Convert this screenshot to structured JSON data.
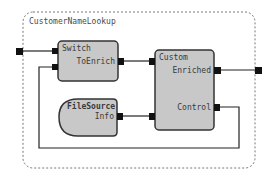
{
  "diagram": {
    "container": {
      "title": "CustomerNameLookup"
    },
    "nodes": [
      {
        "id": "switch",
        "label": "Switch",
        "shape": "rounded-rect",
        "ports_in": [
          "in1",
          "in2"
        ],
        "ports_out": [
          {
            "label": "ToEnrich"
          }
        ]
      },
      {
        "id": "custom",
        "label": "Custom",
        "shape": "rounded-rect",
        "ports_in": [
          "in1",
          "in2"
        ],
        "ports_out": [
          {
            "label": "Enriched"
          },
          {
            "label": "Control"
          }
        ]
      },
      {
        "id": "filesource",
        "label": "FileSource",
        "shape": "half-rounded",
        "ports_out": [
          {
            "label": "Info"
          }
        ]
      }
    ],
    "edges": [
      {
        "from": "external-input",
        "to": "switch.in1"
      },
      {
        "from": "switch.ToEnrich",
        "to": "custom.in1"
      },
      {
        "from": "filesource.Info",
        "to": "custom.in2"
      },
      {
        "from": "custom.Enriched",
        "to": "external-output"
      },
      {
        "from": "custom.Control",
        "to": "switch.in2"
      }
    ],
    "colors": {
      "node_fill": "#c8c8c8",
      "node_stroke": "#333333",
      "port": "#111111",
      "container_stroke": "#777777"
    }
  }
}
